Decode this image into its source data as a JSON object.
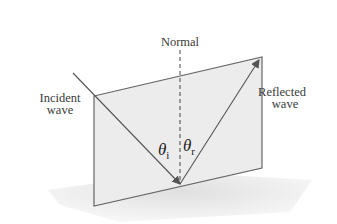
{
  "diagram": {
    "labels": {
      "normal": "Normal",
      "incident_line1": "Incident",
      "incident_line2": "wave",
      "reflected_line1": "Reflected",
      "reflected_line2": "wave",
      "theta_i_symbol": "θ",
      "theta_i_sub": "i",
      "theta_r_symbol": "θ",
      "theta_r_sub": "r"
    },
    "colors": {
      "plane_fill": "#ececec",
      "ground_fill": "#e4e4e4",
      "line": "#555555",
      "text": "#3a3a3a"
    }
  }
}
